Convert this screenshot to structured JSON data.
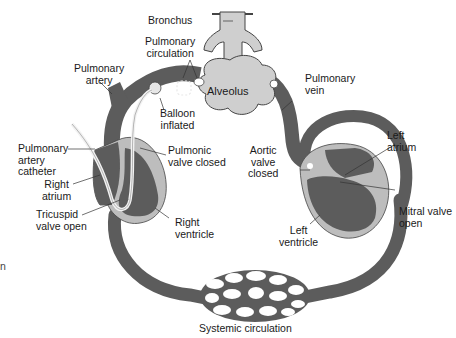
{
  "diagram": {
    "colors": {
      "vessel": "#5c5c5c",
      "vessel_outline": "#3c3c3c",
      "lung_tissue": "#cfcfcf",
      "myocardium": "#bdbdbd",
      "catheter": "#f2f2f2",
      "balloon": "#e6e6e6",
      "text": "#1a1a1a",
      "background": "#ffffff"
    },
    "labels": {
      "bronchus": "Bronchus",
      "pulmonary_circulation": "Pulmonary\ncirculation",
      "pulmonary_artery": "Pulmonary\nartery",
      "alveolus": "Alveolus",
      "pulmonary_vein": "Pulmonary\nvein",
      "balloon_inflated": "Balloon\ninflated",
      "pulmonary_artery_catheter": "Pulmonary\nartery\ncatheter",
      "pulmonic_valve_closed": "Pulmonic\nvalve closed",
      "aortic_valve_closed": "Aortic\nvalve\nclosed",
      "left_atrium": "Left\natrium",
      "right_atrium": "Right\natrium",
      "tricuspid_valve_open": "Tricuspid\nvalve open",
      "right_ventricle": "Right\nventricle",
      "mitral_valve_open": "Mitral valve\nopen",
      "left_ventricle": "Left\nventricle",
      "systemic_circulation": "Systemic circulation",
      "edge_fragment": "n"
    }
  }
}
